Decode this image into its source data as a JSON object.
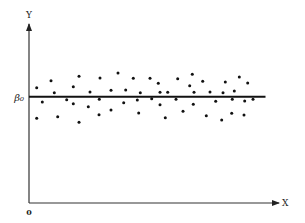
{
  "chart_data": {
    "type": "scatter",
    "title": "",
    "xlabel": "X",
    "ylabel": "Y",
    "origin_label": "0",
    "reference_line": {
      "label": "β₀",
      "y": 106.3,
      "x_start": 0,
      "x_end": 236.5
    },
    "xlim": [
      0,
      249
    ],
    "ylim": [
      0,
      178
    ],
    "grid": false,
    "legend": null,
    "note": "Residual-style scatter of points randomly dispersed around a horizontal line at β₀; coordinates are in plot units (pixels from origin).",
    "points": [
      {
        "x": 7.7,
        "y": 115.3
      },
      {
        "x": 7.7,
        "y": 84.7
      },
      {
        "x": 13.3,
        "y": 101
      },
      {
        "x": 22,
        "y": 122.3
      },
      {
        "x": 25.3,
        "y": 110.3
      },
      {
        "x": 28.7,
        "y": 86.3
      },
      {
        "x": 37.7,
        "y": 103.3
      },
      {
        "x": 44.3,
        "y": 116.3
      },
      {
        "x": 44.3,
        "y": 99.3
      },
      {
        "x": 50,
        "y": 126.7
      },
      {
        "x": 50,
        "y": 80.7
      },
      {
        "x": 59.3,
        "y": 96.3
      },
      {
        "x": 61,
        "y": 111
      },
      {
        "x": 70,
        "y": 88.3
      },
      {
        "x": 70.3,
        "y": 103.7
      },
      {
        "x": 71,
        "y": 125
      },
      {
        "x": 82,
        "y": 112.7
      },
      {
        "x": 82,
        "y": 93
      },
      {
        "x": 89,
        "y": 130
      },
      {
        "x": 94.7,
        "y": 100.3
      },
      {
        "x": 96.7,
        "y": 113
      },
      {
        "x": 104.3,
        "y": 124.7
      },
      {
        "x": 108.3,
        "y": 103
      },
      {
        "x": 109.7,
        "y": 90
      },
      {
        "x": 111.3,
        "y": 110.3
      },
      {
        "x": 121,
        "y": 124.7
      },
      {
        "x": 122.7,
        "y": 104.3
      },
      {
        "x": 129.3,
        "y": 119.7
      },
      {
        "x": 131,
        "y": 98.3
      },
      {
        "x": 131,
        "y": 110.7
      },
      {
        "x": 136.3,
        "y": 85.3
      },
      {
        "x": 138.7,
        "y": 110.7
      },
      {
        "x": 147,
        "y": 103.7
      },
      {
        "x": 148.7,
        "y": 124.3
      },
      {
        "x": 154,
        "y": 91.7
      },
      {
        "x": 160.7,
        "y": 117.3
      },
      {
        "x": 163.3,
        "y": 128.7
      },
      {
        "x": 164.3,
        "y": 98.7
      },
      {
        "x": 165,
        "y": 110.7
      },
      {
        "x": 173.7,
        "y": 121.7
      },
      {
        "x": 177.3,
        "y": 87.3
      },
      {
        "x": 181,
        "y": 111
      },
      {
        "x": 186.7,
        "y": 101.7
      },
      {
        "x": 192.7,
        "y": 83
      },
      {
        "x": 194,
        "y": 110.3
      },
      {
        "x": 196.3,
        "y": 121
      },
      {
        "x": 202.7,
        "y": 89.7
      },
      {
        "x": 203.3,
        "y": 103.7
      },
      {
        "x": 205.3,
        "y": 112
      },
      {
        "x": 210.3,
        "y": 126
      },
      {
        "x": 215,
        "y": 88
      },
      {
        "x": 215.7,
        "y": 102
      },
      {
        "x": 218.7,
        "y": 120
      },
      {
        "x": 224,
        "y": 103.7
      }
    ]
  },
  "axes": {
    "origin_px": {
      "x": 29,
      "y": 203
    },
    "x_end_px": 279,
    "y_top_px": 24
  }
}
